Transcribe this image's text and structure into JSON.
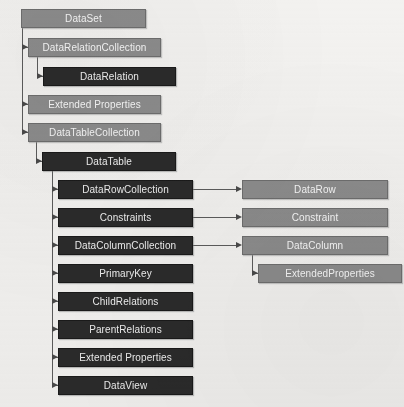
{
  "diagram": {
    "colors": {
      "background": "#f3f2f0",
      "dark_node_fill": "#2b2b2b",
      "dark_node_text": "#f0f0f0",
      "light_node_fill": "#8c8c8c",
      "light_node_text": "#f7f7f7",
      "connector": "#5c5c5c"
    },
    "nodes": {
      "dataset": {
        "label": "DataSet",
        "style": "light",
        "x": 21,
        "y": 9,
        "w": 125,
        "h": 19
      },
      "data_relation_collection": {
        "label": "DataRelationCollection",
        "style": "light",
        "x": 28,
        "y": 38,
        "w": 133,
        "h": 19
      },
      "data_relation": {
        "label": "DataRelation",
        "style": "dark",
        "x": 43,
        "y": 67,
        "w": 133,
        "h": 19
      },
      "extended_properties_ds": {
        "label": "Extended Properties",
        "style": "light",
        "x": 28,
        "y": 95,
        "w": 133,
        "h": 19
      },
      "data_table_collection": {
        "label": "DataTableCollection",
        "style": "light",
        "x": 28,
        "y": 123,
        "w": 133,
        "h": 19
      },
      "data_table": {
        "label": "DataTable",
        "style": "dark",
        "x": 42,
        "y": 152,
        "w": 134,
        "h": 19
      },
      "data_row_collection": {
        "label": "DataRowCollection",
        "style": "dark",
        "x": 58,
        "y": 180,
        "w": 135,
        "h": 19
      },
      "constraints": {
        "label": "Constraints",
        "style": "dark",
        "x": 58,
        "y": 208,
        "w": 135,
        "h": 19
      },
      "data_column_collection": {
        "label": "DataColumnCollection",
        "style": "dark",
        "x": 58,
        "y": 236,
        "w": 135,
        "h": 19
      },
      "primary_key": {
        "label": "PrimaryKey",
        "style": "dark",
        "x": 58,
        "y": 264,
        "w": 135,
        "h": 19
      },
      "child_relations": {
        "label": "ChildRelations",
        "style": "dark",
        "x": 58,
        "y": 292,
        "w": 135,
        "h": 19
      },
      "parent_relations": {
        "label": "ParentRelations",
        "style": "dark",
        "x": 58,
        "y": 320,
        "w": 135,
        "h": 19
      },
      "extended_properties_dt": {
        "label": "Extended Properties",
        "style": "dark",
        "x": 58,
        "y": 348,
        "w": 135,
        "h": 19
      },
      "data_view": {
        "label": "DataView",
        "style": "dark",
        "x": 58,
        "y": 376,
        "w": 135,
        "h": 19
      },
      "data_row": {
        "label": "DataRow",
        "style": "light",
        "x": 242,
        "y": 180,
        "w": 146,
        "h": 19
      },
      "constraint": {
        "label": "Constraint",
        "style": "light",
        "x": 242,
        "y": 208,
        "w": 146,
        "h": 19
      },
      "data_column": {
        "label": "DataColumn",
        "style": "light",
        "x": 242,
        "y": 236,
        "w": 146,
        "h": 19
      },
      "extended_properties_dc": {
        "label": "ExtendedProperties",
        "style": "light",
        "x": 258,
        "y": 264,
        "w": 144,
        "h": 19
      }
    },
    "edges": [
      {
        "from": "dataset",
        "to": "data_relation_collection"
      },
      {
        "from": "dataset",
        "to": "extended_properties_ds"
      },
      {
        "from": "dataset",
        "to": "data_table_collection"
      },
      {
        "from": "data_relation_collection",
        "to": "data_relation"
      },
      {
        "from": "data_table_collection",
        "to": "data_table"
      },
      {
        "from": "data_table",
        "to": "data_row_collection"
      },
      {
        "from": "data_table",
        "to": "constraints"
      },
      {
        "from": "data_table",
        "to": "data_column_collection"
      },
      {
        "from": "data_table",
        "to": "primary_key"
      },
      {
        "from": "data_table",
        "to": "child_relations"
      },
      {
        "from": "data_table",
        "to": "parent_relations"
      },
      {
        "from": "data_table",
        "to": "extended_properties_dt"
      },
      {
        "from": "data_table",
        "to": "data_view"
      },
      {
        "from": "data_row_collection",
        "to": "data_row"
      },
      {
        "from": "constraints",
        "to": "constraint"
      },
      {
        "from": "data_column_collection",
        "to": "data_column"
      },
      {
        "from": "data_column",
        "to": "extended_properties_dc"
      }
    ]
  }
}
